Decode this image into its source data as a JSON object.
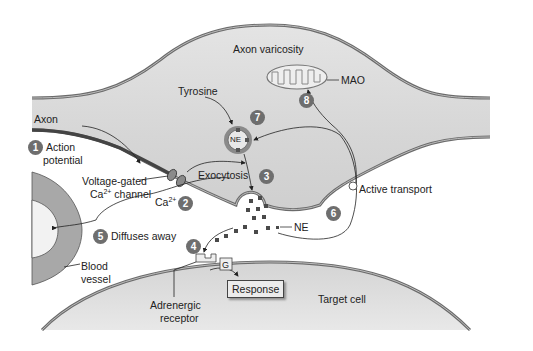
{
  "diagram": {
    "colors": {
      "membrane": "#6b6b6b",
      "cytoplasm": "#d9d9d9",
      "vessel_wall": "#a8a8a8",
      "badge": "#6e6e6e"
    },
    "labels": {
      "axon_varicosity": "Axon varicosity",
      "axon": "Axon",
      "tyrosine": "Tyrosine",
      "mao": "MAO",
      "ne_vesicle": "NE",
      "action_potential_1": "Action",
      "action_potential_2": "potential",
      "voltage_gated_1": "Voltage-gated",
      "voltage_gated_2a": "Ca",
      "voltage_gated_2sup": "2+",
      "voltage_gated_2b": " channel",
      "ca_ion": "Ca",
      "ca_ion_sup": "2+",
      "exocytosis": "Exocytosis",
      "active_transport": "Active transport",
      "ne": "NE",
      "diffuses_away": "Diffuses away",
      "blood_vessel_1": "Blood",
      "blood_vessel_2": "vessel",
      "g_protein": "G",
      "response": "Response",
      "adrenergic_1": "Adrenergic",
      "adrenergic_2": "receptor",
      "target_cell": "Target cell"
    },
    "steps": [
      "1",
      "2",
      "3",
      "4",
      "5",
      "6",
      "7",
      "8"
    ]
  }
}
